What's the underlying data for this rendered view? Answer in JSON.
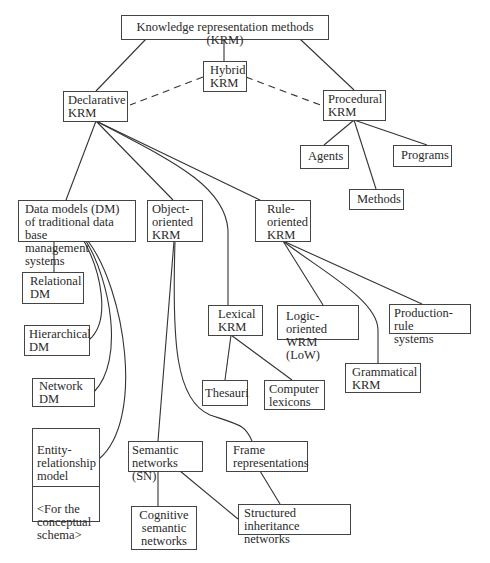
{
  "diagram": {
    "title": "Knowledge representation methods (KRM)",
    "nodes": {
      "root": "Knowledge representation methods (KRM)",
      "hybrid": "Hybrid\nKRM",
      "declarative": "Declarative\nKRM",
      "procedural": "Procedural\nKRM",
      "agents": "Agents",
      "programs": "Programs",
      "methods": "Methods",
      "data_models": "Data models (DM)\nof traditional data base\nmanagement systems",
      "object_oriented": "Object-\noriented\nKRM",
      "rule_oriented": "Rule-\noriented\nKRM",
      "relational": "Relational\nDM",
      "hierarchical": "Hierarchical\nDM",
      "network": "Network\nDM",
      "entity_relationship": "Entity-\nrelationship\nmodel",
      "entity_relationship_note": "<For the\n  conceptual\n  schema>",
      "lexical": "Lexical\nKRM",
      "logic_oriented": "Logic-oriented\nWRM   (LoW)",
      "production_rule": "Production-rule\nsystems",
      "thesauri": "Thesauri",
      "computer_lexicons": "Computer\nlexicons",
      "grammatical": "Grammatical\nKRM",
      "semantic_networks": "Semantic\nnetworks (SN)",
      "frame": "Frame\nrepresentations",
      "cognitive": "Cognitive\nsemantic\nnetworks",
      "structured_inheritance": "Structured inheritance\nnetworks"
    },
    "edges": [
      {
        "from": "root",
        "to": "declarative",
        "style": "solid"
      },
      {
        "from": "root",
        "to": "hybrid",
        "style": "solid"
      },
      {
        "from": "root",
        "to": "procedural",
        "style": "solid"
      },
      {
        "from": "hybrid",
        "to": "declarative",
        "style": "dashed"
      },
      {
        "from": "hybrid",
        "to": "procedural",
        "style": "dashed"
      },
      {
        "from": "procedural",
        "to": "agents",
        "style": "solid"
      },
      {
        "from": "procedural",
        "to": "methods",
        "style": "solid"
      },
      {
        "from": "procedural",
        "to": "programs",
        "style": "solid"
      },
      {
        "from": "declarative",
        "to": "data_models",
        "style": "solid"
      },
      {
        "from": "declarative",
        "to": "object_oriented",
        "style": "solid"
      },
      {
        "from": "declarative",
        "to": "lexical",
        "style": "solid"
      },
      {
        "from": "declarative",
        "to": "rule_oriented",
        "style": "solid"
      },
      {
        "from": "data_models",
        "to": "relational",
        "style": "solid"
      },
      {
        "from": "data_models",
        "to": "hierarchical",
        "style": "solid"
      },
      {
        "from": "data_models",
        "to": "network",
        "style": "solid"
      },
      {
        "from": "data_models",
        "to": "entity_relationship",
        "style": "solid"
      },
      {
        "from": "object_oriented",
        "to": "semantic_networks",
        "style": "solid"
      },
      {
        "from": "object_oriented",
        "to": "frame",
        "style": "solid"
      },
      {
        "from": "rule_oriented",
        "to": "logic_oriented",
        "style": "solid"
      },
      {
        "from": "rule_oriented",
        "to": "grammatical",
        "style": "solid"
      },
      {
        "from": "rule_oriented",
        "to": "production_rule",
        "style": "solid"
      },
      {
        "from": "lexical",
        "to": "thesauri",
        "style": "solid"
      },
      {
        "from": "lexical",
        "to": "computer_lexicons",
        "style": "solid"
      },
      {
        "from": "semantic_networks",
        "to": "cognitive",
        "style": "solid"
      },
      {
        "from": "semantic_networks",
        "to": "structured_inheritance",
        "style": "solid"
      },
      {
        "from": "frame",
        "to": "structured_inheritance",
        "style": "solid"
      }
    ]
  }
}
